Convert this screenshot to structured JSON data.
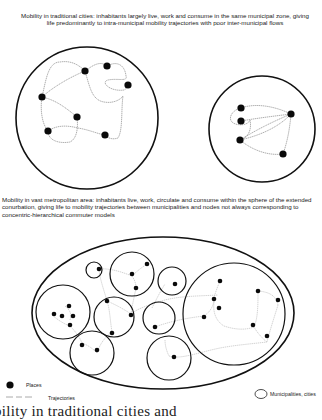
{
  "captions": {
    "traditional": "Mobility in traditional cities: inhabitants largely live, work and consume in the same municipal zone, giving life predominantly to intra-municipal  mobility trajectories with poor inter-municipal flows",
    "metropolitan": "Mobility in vast metropolitan area: inhabitants live, work, circulate and consume within the sphere of the extended conurbation, giving life to mobility trajectories between municipalities and nodes not always corresponding to concentric-hierarchical commuter models"
  },
  "legend": {
    "places": "Places",
    "trajectories": "Trajectories",
    "municipalities": "Municipalities, cities"
  },
  "footer_text": "bility in traditional cities and",
  "colors": {
    "stroke": "#111111",
    "trajectory": "#9a9a9a",
    "place": "#0a0a0a"
  },
  "diagram": {
    "traditional_cities": [
      {
        "cx": 87,
        "cy": 118,
        "r": 71,
        "places": [
          [
            85,
            71
          ],
          [
            107,
            66
          ],
          [
            128,
            85
          ],
          [
            42,
            97
          ],
          [
            77,
            117
          ],
          [
            48,
            131
          ],
          [
            105,
            135
          ]
        ]
      },
      {
        "cx": 262,
        "cy": 129,
        "r": 53,
        "places": [
          [
            241,
            108
          ],
          [
            241,
            121
          ],
          [
            291,
            114
          ],
          [
            240,
            140
          ],
          [
            283,
            154
          ]
        ]
      }
    ],
    "metropolitan_area": {
      "ellipse": {
        "cx": 163,
        "cy": 313,
        "rx": 131,
        "ry": 76
      },
      "municipalities": [
        {
          "cx": 94,
          "cy": 270,
          "r": 8
        },
        {
          "cx": 132,
          "cy": 274,
          "r": 22
        },
        {
          "cx": 172,
          "cy": 281,
          "r": 14
        },
        {
          "cx": 63,
          "cy": 312,
          "r": 27
        },
        {
          "cx": 114,
          "cy": 317,
          "r": 20
        },
        {
          "cx": 159,
          "cy": 318,
          "r": 16
        },
        {
          "cx": 92,
          "cy": 353,
          "r": 22
        },
        {
          "cx": 169,
          "cy": 358,
          "r": 22
        },
        {
          "cx": 234,
          "cy": 314,
          "r": 51
        }
      ]
    }
  }
}
